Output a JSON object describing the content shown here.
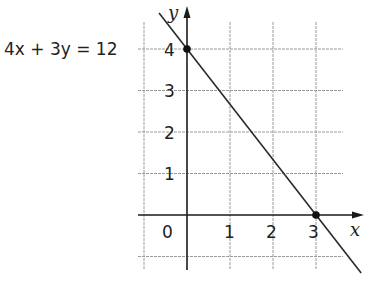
{
  "chart_data": {
    "type": "line",
    "title": "",
    "xlabel": "x",
    "ylabel": "y",
    "xlim": [
      -1,
      4
    ],
    "ylim": [
      -1,
      4.5
    ],
    "grid": true,
    "x_ticks": [
      "0",
      "1",
      "2",
      "3"
    ],
    "y_ticks": [
      "1",
      "2",
      "3",
      "4"
    ],
    "series": [
      {
        "name": "4x + 3y = 12",
        "equation": "4x + 3y = 12",
        "slope": -1.3333,
        "intercept": 4,
        "x_range": [
          -0.65,
          4.05
        ]
      }
    ],
    "points": [
      {
        "x": 0,
        "y": 4
      },
      {
        "x": 3,
        "y": 0
      }
    ],
    "annotations": [
      {
        "text": "4x + 3y = 12",
        "at": "y=4, left of axis"
      }
    ]
  }
}
